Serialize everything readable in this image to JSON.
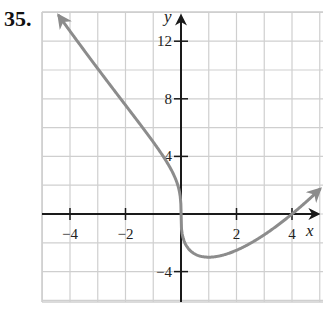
{
  "problem_number": "35.",
  "chart_data": {
    "type": "line",
    "title": "",
    "xlabel": "x",
    "ylabel": "y",
    "xlim": [
      -5,
      5
    ],
    "ylim": [
      -6,
      14
    ],
    "grid": true,
    "x_ticks": [
      -4,
      -2,
      2,
      4
    ],
    "x_tick_labels": [
      "−4",
      "−2",
      "2",
      "4"
    ],
    "y_ticks": [
      12,
      8,
      4,
      -4
    ],
    "y_tick_labels": [
      "12",
      "8",
      "4",
      "−4"
    ],
    "series": [
      {
        "name": "f(x) = x^(1/3)(x − 4)",
        "x": [
          -4.4,
          -4,
          -3,
          -2,
          -1,
          -0.5,
          -0.1,
          0,
          0.1,
          0.5,
          1,
          2,
          3,
          4,
          5
        ],
        "values": [
          13.4,
          12.7,
          9.0,
          7.6,
          5.0,
          3.6,
          1.9,
          0,
          -1.8,
          -2.8,
          -3.0,
          -2.5,
          -1.4,
          0,
          1.7
        ],
        "arrows_at_ends": true,
        "color": "#8c8c8c"
      }
    ]
  },
  "colors": {
    "grid": "#cfcfcf",
    "axis": "#1a1a1a",
    "curve": "#8c8c8c"
  }
}
